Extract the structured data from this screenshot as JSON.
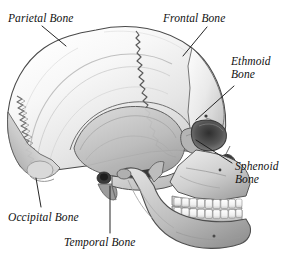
{
  "figure": {
    "background_color": "#ffffff",
    "label_color": "#111111",
    "leader_line_color": "#1a1a1a",
    "style": "grayscale anatomical engraving",
    "width": 291,
    "height": 269
  },
  "labels": [
    {
      "id": "parietal",
      "name": "Parietal Bone",
      "line1": "Parietal Bone",
      "line2": "",
      "x": 8,
      "y": 12,
      "leader": {
        "from_x": 42,
        "from_y": 26,
        "to_x": 66,
        "to_y": 46
      }
    },
    {
      "id": "frontal",
      "name": "Frontal Bone",
      "line1": "Frontal Bone",
      "line2": "",
      "x": 163,
      "y": 12,
      "leader": {
        "from_x": 207,
        "from_y": 27,
        "to_x": 183,
        "to_y": 56
      }
    },
    {
      "id": "ethmoid",
      "name": "Ethmoid Bone",
      "line1": "Ethmoid",
      "line2": "Bone",
      "x": 231,
      "y": 55,
      "leader": {
        "from_x": 234,
        "from_y": 86,
        "to_x": 196,
        "to_y": 120
      }
    },
    {
      "id": "sphenoid",
      "name": "Sphenoid Bone",
      "line1": "Sphenoid",
      "line2": "Bone",
      "x": 235,
      "y": 160,
      "leader": {
        "from_x": 232,
        "from_y": 163,
        "to_x": 196,
        "to_y": 140
      }
    },
    {
      "id": "occipital",
      "name": "Occipital Bone",
      "line1": "Occipital Bone",
      "line2": "",
      "x": 8,
      "y": 211,
      "leader": {
        "from_x": 36,
        "from_y": 178,
        "to_x": 41,
        "to_y": 207
      }
    },
    {
      "id": "temporal",
      "name": "Temporal Bone",
      "line1": "Temporal Bone",
      "line2": "",
      "x": 64,
      "y": 236,
      "leader": {
        "from_x": 110,
        "from_y": 186,
        "to_x": 110,
        "to_y": 233
      }
    }
  ],
  "anatomy": {
    "view": "lateral right-facing",
    "sutures": [
      "coronal",
      "lambdoid",
      "squamosal"
    ],
    "structures": [
      "cranial vault",
      "orbit",
      "nasal aperture",
      "zygomatic arch",
      "maxilla",
      "mandible",
      "teeth",
      "mastoid process",
      "external acoustic meatus"
    ],
    "teeth_upper_count": 9,
    "teeth_lower_count": 9
  }
}
